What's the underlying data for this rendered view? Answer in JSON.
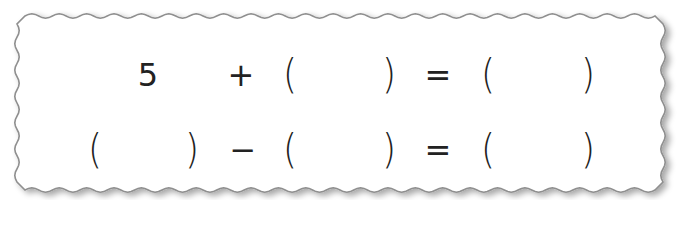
{
  "worksheet": {
    "frame": {
      "style": "wavy-border",
      "border_color": "#8f8f8f",
      "shadow_color": "#c8c8c8"
    },
    "rows": [
      {
        "tokens": [
          {
            "type": "number",
            "text": "5"
          },
          {
            "type": "operator",
            "text": "+"
          },
          {
            "type": "open",
            "text": "("
          },
          {
            "type": "blank",
            "text": ""
          },
          {
            "type": "close",
            "text": ")"
          },
          {
            "type": "operator",
            "text": "="
          },
          {
            "type": "open",
            "text": "("
          },
          {
            "type": "blank",
            "text": ""
          },
          {
            "type": "close",
            "text": ")"
          }
        ]
      },
      {
        "tokens": [
          {
            "type": "open",
            "text": "("
          },
          {
            "type": "blank",
            "text": ""
          },
          {
            "type": "close",
            "text": ")"
          },
          {
            "type": "operator",
            "text": "−"
          },
          {
            "type": "open",
            "text": "("
          },
          {
            "type": "blank",
            "text": ""
          },
          {
            "type": "close",
            "text": ")"
          },
          {
            "type": "operator",
            "text": "="
          },
          {
            "type": "open",
            "text": "("
          },
          {
            "type": "blank",
            "text": ""
          },
          {
            "type": "close",
            "text": ")"
          }
        ]
      }
    ]
  }
}
